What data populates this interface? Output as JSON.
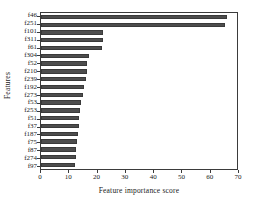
{
  "chart_data": {
    "type": "bar",
    "orientation": "horizontal",
    "title": "",
    "xlabel": "Feature importance score",
    "ylabel": "Features",
    "xlim": [
      0,
      70
    ],
    "ylim": null,
    "grid": false,
    "legend": null,
    "xticks": [
      0,
      10,
      20,
      30,
      40,
      50,
      60,
      70
    ],
    "categories": [
      "f46",
      "f251",
      "f101",
      "f311",
      "f61",
      "f304",
      "f52",
      "f210",
      "f239",
      "f192",
      "f273",
      "f53",
      "f253",
      "f51",
      "f37",
      "f187",
      "f75",
      "f87",
      "f274",
      "f97"
    ],
    "values": [
      65.8,
      65.2,
      22.0,
      22.0,
      21.5,
      17.0,
      16.2,
      16.2,
      16.0,
      15.3,
      15.0,
      14.2,
      13.8,
      13.5,
      13.4,
      13.0,
      12.6,
      12.2,
      12.2,
      12.0
    ],
    "bar_color": "#4d4d4d",
    "frame_color": "#3b3b3b"
  }
}
